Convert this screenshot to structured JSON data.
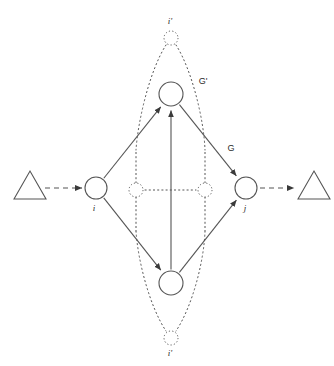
{
  "figure": {
    "background_color": "#ffffff",
    "stroke_color": "#555555",
    "text_color": "#2b2b2b",
    "width": 334,
    "height": 366
  },
  "labels": {
    "top_outer_node": "i'",
    "bottom_outer_node": "i'",
    "left_node": "i",
    "right_node": "j",
    "inner_graph": "G'",
    "outer_graph": "G"
  },
  "nodes": [
    {
      "id": "left",
      "name": "left-node",
      "cx": 96,
      "cy": 188,
      "r": 11,
      "style": "solid",
      "label": "i",
      "label_dx": -2,
      "label_dy": 23
    },
    {
      "id": "right",
      "name": "right-node",
      "cx": 246,
      "cy": 188,
      "r": 11,
      "style": "solid",
      "label": "j",
      "label_dx": -1,
      "label_dy": 23
    },
    {
      "id": "top",
      "name": "top-node",
      "cx": 171,
      "cy": 94,
      "r": 12,
      "style": "solid",
      "label": "",
      "label_dx": 0,
      "label_dy": 0
    },
    {
      "id": "bottom",
      "name": "bottom-node",
      "cx": 171,
      "cy": 283,
      "r": 12,
      "style": "solid",
      "label": "",
      "label_dx": 0,
      "label_dy": 0
    },
    {
      "id": "top-outer",
      "name": "top-outer-node",
      "cx": 171,
      "cy": 38,
      "r": 7,
      "style": "dotted",
      "label": "i'",
      "label_dx": -1,
      "label_dy": -14
    },
    {
      "id": "bottom-outer",
      "name": "bottom-outer-node",
      "cx": 171,
      "cy": 338,
      "r": 7,
      "style": "dotted",
      "label": "i'",
      "label_dx": -1,
      "label_dy": 18
    },
    {
      "id": "center-left",
      "name": "center-left-node",
      "cx": 136,
      "cy": 190,
      "r": 7,
      "style": "dotted",
      "label": "",
      "label_dx": 0,
      "label_dy": 0
    },
    {
      "id": "center-right",
      "name": "center-right-node",
      "cx": 205,
      "cy": 190,
      "r": 7,
      "style": "dotted",
      "label": "",
      "label_dx": 0,
      "label_dy": 0
    }
  ],
  "solid_edges": [
    {
      "name": "edge-left-to-top",
      "from": "left",
      "to": "top",
      "arrow": true
    },
    {
      "name": "edge-bottom-to-top",
      "from": "bottom",
      "to": "top",
      "arrow": true
    },
    {
      "name": "edge-top-to-right",
      "from": "top",
      "to": "right",
      "arrow": true
    },
    {
      "name": "edge-left-to-bottom",
      "from": "left",
      "to": "bottom",
      "arrow": true
    },
    {
      "name": "edge-bottom-to-right",
      "from": "bottom",
      "to": "right",
      "arrow": true
    }
  ],
  "dashed_edges": [
    {
      "name": "edge-input-to-left",
      "x1": 45,
      "y1": 188,
      "x2": 82,
      "y2": 188,
      "arrow": true
    },
    {
      "name": "edge-right-to-output",
      "x1": 260,
      "y1": 188,
      "x2": 294,
      "y2": 188,
      "arrow": true
    }
  ],
  "dotted_edges": [
    {
      "name": "dotted-center-horizontal",
      "x1": 145,
      "y1": 190,
      "x2": 196,
      "y2": 190
    },
    {
      "name": "dotted-center-left-up",
      "x1": 136,
      "y1": 183,
      "x2": 136,
      "y2": 150
    },
    {
      "name": "dotted-center-left-down",
      "x1": 136,
      "y1": 197,
      "x2": 136,
      "y2": 231
    },
    {
      "name": "dotted-center-right-up",
      "x1": 205,
      "y1": 183,
      "x2": 205,
      "y2": 150
    },
    {
      "name": "dotted-center-right-down",
      "x1": 205,
      "y1": 197,
      "x2": 205,
      "y2": 231
    }
  ],
  "dotted_lens": [
    {
      "name": "lens-upper-left",
      "path": "M 166 45 C 150 70 138 120 136 150"
    },
    {
      "name": "lens-upper-right",
      "path": "M 176 45 C 192 70 204 120 205 150"
    },
    {
      "name": "lens-lower-left",
      "path": "M 136 231 C 138 262 150 307 166 331"
    },
    {
      "name": "lens-lower-right",
      "path": "M 205 231 C 204 262 192 307 176 331"
    }
  ],
  "triangles": [
    {
      "name": "input-triangle",
      "points": "14,199 30,171 46,199"
    },
    {
      "name": "output-triangle",
      "points": "298,199 314,171 330,199"
    }
  ],
  "graph_labels": [
    {
      "name": "inner-graph-label",
      "key": "G'",
      "x": 203,
      "y": 84
    },
    {
      "name": "outer-graph-label",
      "key": "G",
      "x": 231,
      "y": 151
    }
  ]
}
